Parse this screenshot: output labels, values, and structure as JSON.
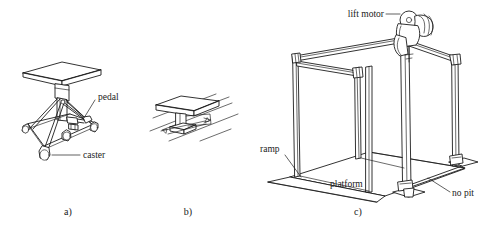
{
  "figure": {
    "background_color": "#ffffff",
    "line_color": "#1c1c1c",
    "panels": [
      {
        "id": "a",
        "caption": "a)",
        "title": "tripod lift table on casters",
        "labels": [
          {
            "name": "pedal",
            "text": "pedal"
          },
          {
            "name": "caster",
            "text": "caster"
          }
        ]
      },
      {
        "id": "b",
        "caption": "b)",
        "title": "table on floor rails",
        "labels": []
      },
      {
        "id": "c",
        "caption": "c)",
        "title": "gantry frame lift with platform",
        "labels": [
          {
            "name": "lift-motor",
            "text": "lift motor"
          },
          {
            "name": "ramp",
            "text": "ramp"
          },
          {
            "name": "platform",
            "text": "platform"
          },
          {
            "name": "no-pit",
            "text": "no pit"
          }
        ]
      }
    ]
  },
  "panel_a": {
    "caption": "a)",
    "label_pedal": "pedal",
    "label_caster": "caster"
  },
  "panel_b": {
    "caption": "b)"
  },
  "panel_c": {
    "caption": "c)",
    "label_lift_motor": "lift motor",
    "label_ramp": "ramp",
    "label_platform": "platform",
    "label_no_pit": "no pit"
  }
}
